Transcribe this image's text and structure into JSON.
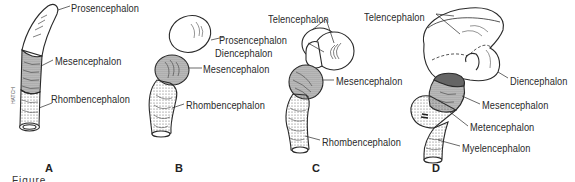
{
  "figure": {
    "panels": [
      {
        "id": "A",
        "label": "A",
        "structures": [
          "Prosencephalon",
          "Mesencephalon",
          "Rhombencephalon"
        ]
      },
      {
        "id": "B",
        "label": "B",
        "structures": [
          "Prosencephalon",
          "Mesencephalon",
          "Rhombencephalon"
        ]
      },
      {
        "id": "C",
        "label": "C",
        "structures": [
          "Telencephalon",
          "Diencephalon",
          "Mesencephalon",
          "Rhombencephalon"
        ]
      },
      {
        "id": "D",
        "label": "D",
        "structures": [
          "Telencephalon",
          "Diencephalon",
          "Mesencephalon",
          "Metencephalon",
          "Myelencephalon"
        ]
      }
    ],
    "labels": {
      "a_prosencephalon": "Prosencephalon",
      "a_mesencephalon": "Mesencephalon",
      "a_rhombencephalon": "Rhombencephalon",
      "b_prosencephalon": "Prosencephalon",
      "b_mesencephalon": "Mesencephalon",
      "b_rhombencephalon": "Rhombencephalon",
      "c_telencephalon": "Telencephalon",
      "c_diencephalon": "Diencephalon",
      "c_mesencephalon": "Mesencephalon",
      "c_rhombencephalon": "Rhombencephalon",
      "d_telencephalon": "Telencephalon",
      "d_diencephalon": "Diencephalon",
      "d_mesencephalon": "Mesencephalon",
      "d_metencephalon": "Metencephalon",
      "d_myelencephalon": "Myelencephalon"
    },
    "panel_letters": {
      "a": "A",
      "b": "B",
      "c": "C",
      "d": "D"
    },
    "caption_fragment": "Figure"
  },
  "colors": {
    "ink": "#2a2a2a",
    "shade": "#b8b8b8",
    "background": "#ffffff"
  }
}
